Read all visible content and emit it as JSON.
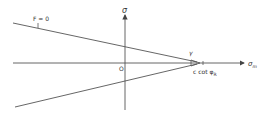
{
  "diagram": {
    "labels": {
      "vertical_axis": "σ",
      "horizontal_axis": "σ",
      "horizontal_axis_sub": "m",
      "origin": "O",
      "upper_line": "F = 0",
      "angle": "γ",
      "apex_prefix": "c cot φ",
      "apex_sub": "R"
    },
    "colors": {
      "line": "#555555",
      "background": "#ffffff"
    }
  }
}
